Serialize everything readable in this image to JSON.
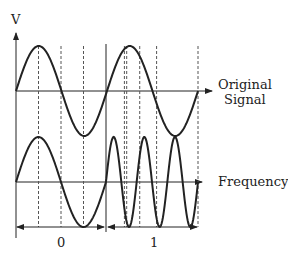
{
  "diagram": {
    "y_axis_label": "V",
    "top_trace_label_line1": "Original",
    "top_trace_label_line2": "Signal",
    "bottom_trace_label": "Frequency",
    "bit_labels": [
      "0",
      "1"
    ],
    "colors": {
      "ink": "#222222",
      "dash": "#555555"
    },
    "top_signal": {
      "cycles_over_bits": 2,
      "description": "continuous sine wave spanning both bit periods"
    },
    "bottom_signal": {
      "bit_0_cycles": 1,
      "bit_1_cycles": 3,
      "description": "low frequency for bit 0, high frequency for bit 1"
    }
  }
}
